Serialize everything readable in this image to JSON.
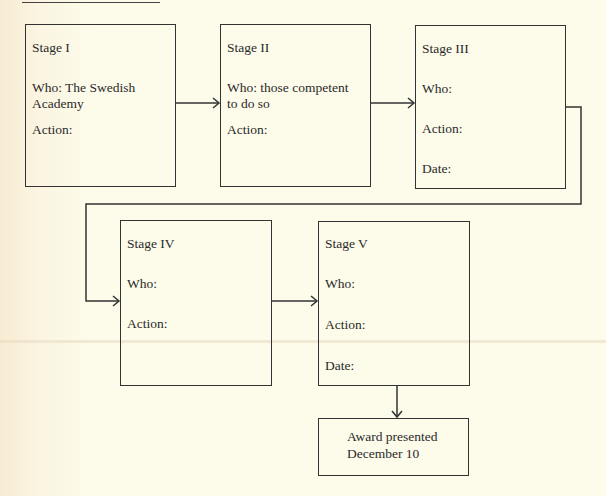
{
  "diagram": {
    "type": "flowchart",
    "stages": [
      {
        "id": "stage-1",
        "title": "Stage I",
        "who": "Who: The Swedish",
        "who2": "Academy",
        "action": "Action:"
      },
      {
        "id": "stage-2",
        "title": "Stage II",
        "who": "Who: those competent",
        "who2": "to do so",
        "action": "Action:"
      },
      {
        "id": "stage-3",
        "title": "Stage III",
        "who": "Who:",
        "action": "Action:",
        "date": "Date:"
      },
      {
        "id": "stage-4",
        "title": "Stage IV",
        "who": "Who:",
        "action": "Action:"
      },
      {
        "id": "stage-5",
        "title": "Stage V",
        "who": "Who:",
        "action": "Action:",
        "date": "Date:"
      }
    ],
    "final": {
      "line1": "Award presented",
      "line2": "December 10"
    },
    "edges": [
      [
        "stage-1",
        "stage-2"
      ],
      [
        "stage-2",
        "stage-3"
      ],
      [
        "stage-3",
        "stage-4"
      ],
      [
        "stage-4",
        "stage-5"
      ],
      [
        "stage-5",
        "final"
      ]
    ],
    "colors": {
      "line": "#333333",
      "background": "#fdfbe9"
    }
  }
}
